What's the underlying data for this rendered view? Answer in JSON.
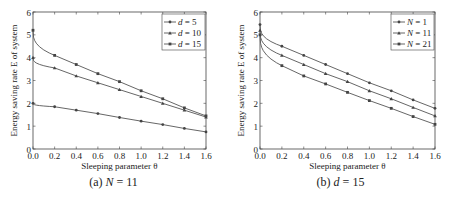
{
  "chart_data": [
    {
      "type": "line",
      "caption_prefix": "(a)",
      "caption_var": "N",
      "caption_value": "= 11",
      "xlabel": "Sleeping parameter θ",
      "ylabel": "Energy saving rate E of system",
      "xlim": [
        0,
        1.6
      ],
      "ylim": [
        0,
        6
      ],
      "xticks": [
        "0.0",
        "0.2",
        "0.4",
        "0.6",
        "0.8",
        "1.0",
        "1.2",
        "1.4",
        "1.6"
      ],
      "yticks": [
        "0",
        "1",
        "2",
        "3",
        "4",
        "5",
        "6"
      ],
      "grid": false,
      "legend_position": "upper right",
      "x": [
        0.0,
        0.2,
        0.4,
        0.6,
        0.8,
        1.0,
        1.2,
        1.4,
        1.6
      ],
      "series": [
        {
          "name": "d = 5",
          "var": "d",
          "val": "= 5",
          "values": [
            2.0,
            1.85,
            1.7,
            1.55,
            1.38,
            1.22,
            1.07,
            0.9,
            0.75
          ]
        },
        {
          "name": "d = 10",
          "var": "d",
          "val": "= 10",
          "values": [
            4.0,
            3.55,
            3.2,
            2.9,
            2.6,
            2.3,
            2.0,
            1.7,
            1.4
          ]
        },
        {
          "name": "d = 15",
          "var": "d",
          "val": "= 15",
          "values": [
            5.2,
            4.1,
            3.7,
            3.3,
            2.95,
            2.55,
            2.2,
            1.8,
            1.45
          ]
        }
      ]
    },
    {
      "type": "line",
      "caption_prefix": "(b)",
      "caption_var": "d",
      "caption_value": "= 15",
      "xlabel": "Sleeping parameter θ",
      "ylabel": "Energy saving rate E of system",
      "xlim": [
        0,
        1.6
      ],
      "ylim": [
        0,
        6
      ],
      "xticks": [
        "0.0",
        "0.2",
        "0.4",
        "0.6",
        "0.8",
        "1.0",
        "1.2",
        "1.4",
        "1.6"
      ],
      "yticks": [
        "0",
        "1",
        "2",
        "3",
        "4",
        "5",
        "6"
      ],
      "grid": false,
      "legend_position": "upper right",
      "x": [
        0.0,
        0.2,
        0.4,
        0.6,
        0.8,
        1.0,
        1.2,
        1.4,
        1.6
      ],
      "series": [
        {
          "name": "N = 1",
          "var": "N",
          "val": "= 1",
          "values": [
            5.45,
            4.5,
            4.1,
            3.7,
            3.3,
            2.9,
            2.55,
            2.15,
            1.78
          ]
        },
        {
          "name": "N = 11",
          "var": "N",
          "val": "= 11",
          "values": [
            5.2,
            4.1,
            3.7,
            3.3,
            2.95,
            2.55,
            2.2,
            1.82,
            1.45
          ]
        },
        {
          "name": "N = 21",
          "var": "N",
          "val": "= 21",
          "values": [
            5.0,
            3.65,
            3.2,
            2.85,
            2.48,
            2.12,
            1.78,
            1.42,
            1.08
          ]
        }
      ]
    }
  ]
}
